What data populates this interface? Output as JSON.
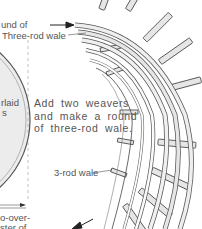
{
  "labels": {
    "top_partial": "und of",
    "three_rod_wale": "Three-rod wale",
    "left_partial_1": "rlaid",
    "left_partial_2": "s",
    "three_rod_wale_short": "3-rod wale",
    "bottom_partial_1": "o-over-",
    "bottom_partial_2": "ster of"
  },
  "caption": {
    "line1": "Add two weavers",
    "line2": "and make a round",
    "line3": "of three-rod wale."
  },
  "colors": {
    "line": "#3a3a3a",
    "rod_fill": "#e6e6e6",
    "base_fill": "#ececec",
    "text": "#555555"
  }
}
